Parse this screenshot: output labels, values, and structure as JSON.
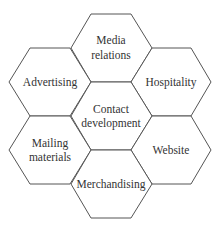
{
  "diagram": {
    "type": "hexagon-cluster",
    "center": {
      "label_lines": [
        "Contact",
        "development"
      ]
    },
    "hexagons": [
      {
        "id": "media-relations",
        "label_lines": [
          "Media",
          "relations"
        ],
        "position": "top"
      },
      {
        "id": "advertising",
        "label_lines": [
          "Advertising"
        ],
        "position": "upper-left"
      },
      {
        "id": "hospitality",
        "label_lines": [
          "Hospitality"
        ],
        "position": "upper-right"
      },
      {
        "id": "contact-development",
        "label_lines": [
          "Contact",
          "development"
        ],
        "position": "center"
      },
      {
        "id": "mailing-materials",
        "label_lines": [
          "Mailing",
          "materials"
        ],
        "position": "lower-left"
      },
      {
        "id": "website",
        "label_lines": [
          "Website"
        ],
        "position": "lower-right"
      },
      {
        "id": "merchandising",
        "label_lines": [
          "Merchandising"
        ],
        "position": "bottom"
      }
    ],
    "colors": {
      "stroke": "#555555",
      "fill": "#ffffff",
      "text": "#333333"
    }
  }
}
